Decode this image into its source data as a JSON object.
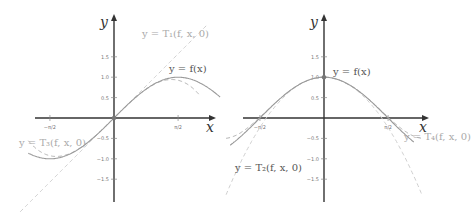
{
  "colors": {
    "axis": "#333333",
    "f": "#9a9a9a",
    "taylor_dark": "#b5b5b5",
    "taylor_light": "#cfcfcf",
    "label_dark": "#555555",
    "label_light": "#aaaaaa"
  },
  "chart_data": [
    {
      "type": "line",
      "title": "",
      "xlabel": "x",
      "ylabel": "y",
      "xlim": [
        -2.3,
        2.6
      ],
      "ylim": [
        -2.2,
        2.0
      ],
      "x_ticks": [
        "-π/2",
        "π/2"
      ],
      "y_ticks": [
        "1.5",
        "1.0",
        "0.5",
        "-0.5",
        "-1.0",
        "-1.5"
      ],
      "series": [
        {
          "name": "y = f(x)",
          "function": "sin(x)",
          "style": "solid"
        },
        {
          "name": "y = T1(f, x, 0)",
          "function": "x",
          "style": "dashed"
        },
        {
          "name": "y = T3(f, x, 0)",
          "function": "x - x^3/6",
          "style": "dashed"
        }
      ],
      "annotations": [
        "y = T1(f, x, 0)",
        "y = f(x)",
        "y = T3(f, x, 0)"
      ]
    },
    {
      "type": "line",
      "title": "",
      "xlabel": "x",
      "ylabel": "y",
      "xlim": [
        -2.6,
        2.4
      ],
      "ylim": [
        -2.2,
        2.0
      ],
      "x_ticks": [
        "-π/2",
        "π/2"
      ],
      "y_ticks": [
        "1.5",
        "1.0",
        "0.5",
        "-0.5",
        "-1.0",
        "-1.5"
      ],
      "series": [
        {
          "name": "y = f(x)",
          "function": "cos(x)",
          "style": "solid"
        },
        {
          "name": "y = T2(f, x, 0)",
          "function": "1 - x^2/2",
          "style": "dashed"
        },
        {
          "name": "y = T4(f, x, 0)",
          "function": "1 - x^2/2 + x^4/24",
          "style": "dashed"
        }
      ],
      "annotations": [
        "y = f(x)",
        "y = T2(f, x, 0)",
        "y = T4(f, x, 0)"
      ]
    }
  ],
  "labels": {
    "left": {
      "y_axis": "y",
      "x_axis": "x",
      "t1": "y = T₁(f, x, 0)",
      "f": "y = f(x)",
      "t3": "y = T₃(f, x, 0)",
      "xneg": "−π/2",
      "xpos": "π/2"
    },
    "right": {
      "y_axis": "y",
      "x_axis": "x",
      "f": "y = f(x)",
      "t2": "y = T₂(f, x, 0)",
      "t4": "y = T₄(f, x, 0)",
      "xneg": "−π/2",
      "xpos": "π/2"
    },
    "yticks": [
      "1.5",
      "1.0",
      "0.5",
      "−0.5",
      "−1.0",
      "−1.5"
    ]
  }
}
